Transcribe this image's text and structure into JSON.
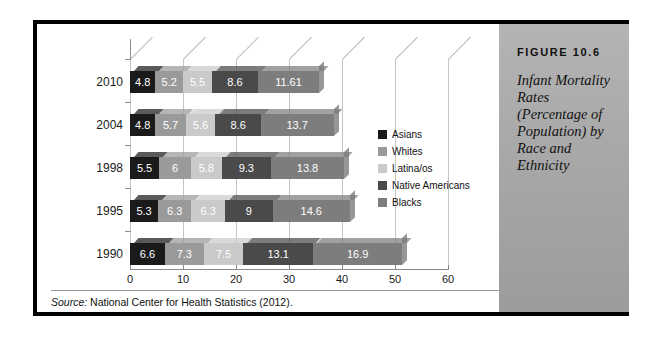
{
  "figure": {
    "number": "FIGURE 10.6",
    "caption": "Infant Mortality Rates (Percentage of Population) by Race and Ethnicity"
  },
  "source": {
    "prefix": "Source:",
    "text": " National Center for Health Statistics (2012)."
  },
  "colors": {
    "asians": "#1a1a1a",
    "whites": "#9a9a9a",
    "latinaos": "#cacaca",
    "native_americans": "#4a4a4a",
    "blacks": "#7d7d7d",
    "panel_bg": "#a8a8a8",
    "frame": "#000000",
    "axis": "#8a8a8a"
  },
  "chart_data": {
    "type": "bar",
    "orientation": "horizontal",
    "stacked": true,
    "title": "Infant Mortality Rates (Percentage of Population) by Race and Ethnicity",
    "xlabel": "",
    "ylabel": "",
    "xlim": [
      0,
      60
    ],
    "xticks": [
      0,
      10,
      20,
      30,
      40,
      50,
      60
    ],
    "xtick_labels": [
      "0",
      "10",
      "20",
      "30",
      "40",
      "50",
      "60"
    ],
    "grid": true,
    "legend_position": "right",
    "categories": [
      "2010",
      "2004",
      "1998",
      "1995",
      "1990"
    ],
    "series": [
      {
        "name": "Asians",
        "color": "#1a1a1a",
        "values": [
          4.8,
          4.8,
          5.5,
          5.3,
          6.6
        ],
        "labels": [
          "4.8",
          "4.8",
          "5.5",
          "5.3",
          "6.6"
        ]
      },
      {
        "name": "Whites",
        "color": "#9a9a9a",
        "values": [
          5.2,
          5.7,
          6,
          6.3,
          7.3
        ],
        "labels": [
          "5.2",
          "5.7",
          "6",
          "6.3",
          "7.3"
        ]
      },
      {
        "name": "Latina/os",
        "color": "#cacaca",
        "values": [
          5.5,
          5.6,
          5.8,
          6.3,
          7.5
        ],
        "labels": [
          "5.5",
          "5.6",
          "5.8",
          "6.3",
          "7.5"
        ]
      },
      {
        "name": "Native Americans",
        "color": "#4a4a4a",
        "values": [
          8.6,
          8.6,
          9.3,
          9,
          13.1
        ],
        "labels": [
          "8.6",
          "8.6",
          "9.3",
          "9",
          "13.1"
        ]
      },
      {
        "name": "Blacks",
        "color": "#7d7d7d",
        "values": [
          11.61,
          13.7,
          13.8,
          14.6,
          16.9
        ],
        "labels": [
          "11.61",
          "13.7",
          "13.8",
          "14.6",
          "16.9"
        ]
      }
    ]
  }
}
